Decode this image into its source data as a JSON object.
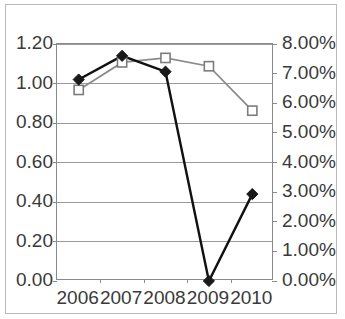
{
  "chart_data": {
    "type": "line",
    "title": "",
    "xlabel": "",
    "ylabel": "",
    "grid": true,
    "legend": "none",
    "categories": [
      "2006",
      "2007",
      "2008",
      "2009",
      "2010"
    ],
    "axes": {
      "left": {
        "ylim": [
          0.0,
          1.2
        ],
        "tick_step": 0.2,
        "tick_labels": [
          "0.00",
          "0.20",
          "0.40",
          "0.60",
          "0.80",
          "1.00",
          "1.20"
        ]
      },
      "right": {
        "ylim": [
          0.0,
          8.0
        ],
        "unit": "%",
        "tick_step": 1.0,
        "tick_labels": [
          "0.00%",
          "1.00%",
          "2.00%",
          "3.00%",
          "4.00%",
          "5.00%",
          "6.00%",
          "7.00%",
          "8.00%"
        ]
      }
    },
    "series": [
      {
        "name": "series-diamond",
        "axis": "left",
        "marker": "filled-diamond",
        "color": "#111111",
        "values": [
          1.02,
          1.14,
          1.06,
          0.0,
          0.44
        ]
      },
      {
        "name": "series-square",
        "axis": "right",
        "marker": "open-square",
        "color": "#8c8c8c",
        "values": [
          6.45,
          7.38,
          7.53,
          7.25,
          5.75
        ]
      }
    ]
  }
}
